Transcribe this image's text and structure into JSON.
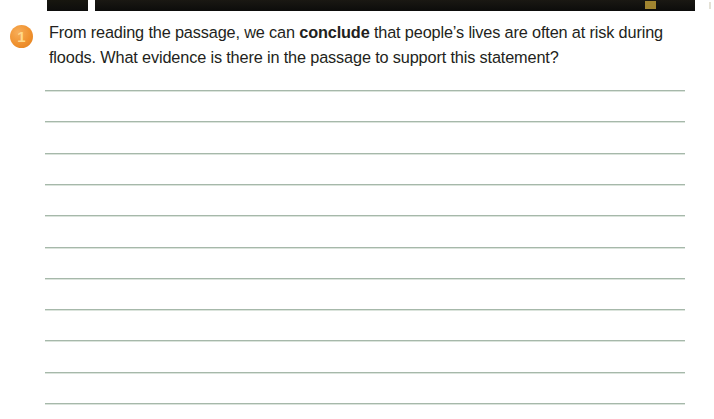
{
  "page": {
    "background_color": "#ffffff",
    "width": 714,
    "height": 419
  },
  "photo_strip": {
    "description": "cropped-bottom-edge-of-photograph",
    "color": "#111110",
    "accent_color": "#a98b33"
  },
  "question": {
    "number": "1",
    "badge_color": "#f0922f",
    "badge_text_color": "#ffd98a",
    "text_part_1": "From reading the passage, we can ",
    "emphasis": "conclude",
    "text_part_2": " that people’s lives are often at risk during floods. What evidence is there in the passage to support this statement?",
    "full_text": "From reading the passage, we can conclude that people’s lives are often at risk during floods. What evidence is there in the passage to support this statement?",
    "text_color": "#231f20"
  },
  "answer_area": {
    "line_count": 11,
    "line_color": "#9fb3a3",
    "first_line_y": 90,
    "line_spacing": 31.3,
    "line_left": 45,
    "line_width": 640
  }
}
